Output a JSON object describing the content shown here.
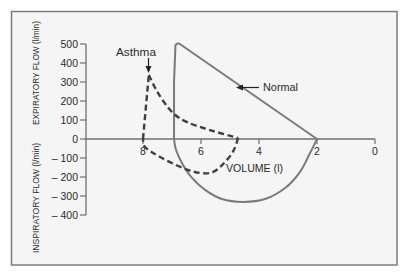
{
  "chart_data": {
    "type": "line",
    "title": "",
    "xlabel": "VOLUME (l)",
    "ylabel_top": "EXPIRATORY FLOW (l/min)",
    "ylabel_bottom": "INSPIRATORY FLOW (l/min)",
    "xlim": [
      8.7,
      0
    ],
    "ylim": [
      -400,
      500
    ],
    "x_inverted": true,
    "grid": false,
    "legend": "none (inline annotations)",
    "xticks": [
      {
        "value": 8,
        "label": "8"
      },
      {
        "value": 6,
        "label": "6"
      },
      {
        "value": 4,
        "label": "4"
      },
      {
        "value": 2,
        "label": "2"
      },
      {
        "value": 0,
        "label": "0"
      }
    ],
    "yticks": [
      {
        "value": 500,
        "label": "500"
      },
      {
        "value": 400,
        "label": "400"
      },
      {
        "value": 300,
        "label": "300"
      },
      {
        "value": 200,
        "label": "200"
      },
      {
        "value": 100,
        "label": "100"
      },
      {
        "value": 0,
        "label": "0"
      },
      {
        "value": -100,
        "label": "– 100"
      },
      {
        "value": -200,
        "label": "– 200"
      },
      {
        "value": -300,
        "label": "– 300"
      },
      {
        "value": -400,
        "label": "– 400"
      }
    ],
    "series": [
      {
        "name": "Normal",
        "style": "solid",
        "color": "#7a7a7a",
        "segments": [
          {
            "smooth": false,
            "points": [
              [
                2.0,
                0
              ],
              [
                6.78,
                505
              ]
            ]
          },
          {
            "smooth": false,
            "points": [
              [
                6.78,
                505
              ],
              [
                6.88,
                495
              ],
              [
                6.93,
                300
              ],
              [
                6.93,
                0
              ]
            ]
          },
          {
            "smooth": true,
            "points": [
              [
                6.93,
                0
              ],
              [
                6.86,
                -58
              ],
              [
                6.62,
                -137
              ],
              [
                6.31,
                -205
              ],
              [
                5.86,
                -268
              ],
              [
                5.28,
                -316
              ],
              [
                4.55,
                -331
              ],
              [
                3.79,
                -316
              ],
              [
                3.1,
                -258
              ],
              [
                2.59,
                -174
              ],
              [
                2.24,
                -74
              ],
              [
                2.0,
                0
              ]
            ]
          }
        ]
      },
      {
        "name": "Asthma",
        "style": "dashed",
        "color": "#3f3f3f",
        "segments": [
          {
            "smooth": false,
            "points": [
              [
                8.0,
                0
              ],
              [
                7.8,
                337
              ]
            ]
          },
          {
            "smooth": true,
            "points": [
              [
                7.8,
                337
              ],
              [
                7.48,
                242
              ],
              [
                7.0,
                142
              ],
              [
                6.48,
                89
              ],
              [
                5.69,
                47
              ],
              [
                4.72,
                5
              ]
            ]
          },
          {
            "smooth": true,
            "points": [
              [
                4.72,
                5
              ],
              [
                4.9,
                -68
              ],
              [
                5.24,
                -132
              ],
              [
                5.59,
                -174
              ],
              [
                6.03,
                -179
              ],
              [
                6.62,
                -153
              ],
              [
                7.41,
                -95
              ],
              [
                7.93,
                -42
              ],
              [
                8.0,
                0
              ]
            ]
          }
        ]
      }
    ],
    "annotations": [
      {
        "text": "Asthma",
        "points_to": [
          7.8,
          337
        ],
        "arrow": "down"
      },
      {
        "text": "Normal",
        "points_to": [
          4.8,
          275
        ],
        "arrow": "left"
      }
    ]
  },
  "labels": {
    "xlabel": "VOLUME (l)",
    "ylabel_top": "EXPIRATORY FLOW (l/min)",
    "ylabel_bottom": "INSPIRATORY FLOW (l/min)",
    "asthma": "Asthma",
    "normal": "Normal"
  },
  "colors": {
    "frame": "#7c7c7c",
    "plot_background": "#f5f5f5",
    "axis": "#6f6f6f",
    "normal_curve": "#7a7a7a",
    "asthma_curve": "#3f3f3f",
    "text": "#2a2a2a"
  }
}
